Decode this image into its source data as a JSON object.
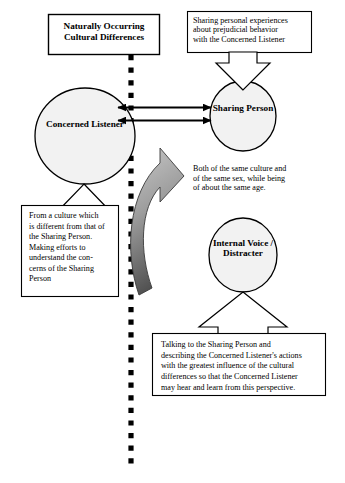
{
  "diagram": {
    "title_box": {
      "text": "Naturally Occurring\nCultural Differences"
    },
    "top_right_box": {
      "text": "Sharing personal experiences\nabout prejudicial behavior\nwith the Concerned Listener"
    },
    "concerned_listener": {
      "label": "Concerned\nListener"
    },
    "sharing_person": {
      "label": "Sharing\nPerson"
    },
    "internal_voice": {
      "label": "Internal\nVoice /\nDistracter"
    },
    "middle_note": {
      "text": "Both of the same culture and\nof the same sex, while being\nof about the same age."
    },
    "left_box": {
      "text": "From a culture which\nis different from that of\nthe Sharing Person.\nMaking efforts to\nunderstand the con-\ncerns of the Sharing\nPerson"
    },
    "bottom_box": {
      "text": "Talking to the Sharing Person and\ndescribing the Concerned Listener's actions\nwith the greatest influence of the cultural\ndifferences so that the Concerned Listener\nmay hear and learn from this perspective."
    },
    "colors": {
      "stroke": "#000000",
      "ellipse_fill": "#f2f2f2",
      "curved_arrow_light": "#b3b3b3",
      "curved_arrow_dark": "#4d4d4d",
      "background": "#ffffff"
    },
    "connectors": {
      "dotted_divider": "vertical-dotted-line",
      "double_arrow_upper": "double-headed-arrow",
      "double_arrow_lower": "double-headed-arrow",
      "curved_arrow": "curved-block-arrow-up",
      "block_arrow_to_listener": "hollow-block-arrow-up",
      "block_arrow_to_sharing": "hollow-block-arrow-down",
      "block_arrow_to_internal_voice": "hollow-block-arrow-up"
    }
  }
}
